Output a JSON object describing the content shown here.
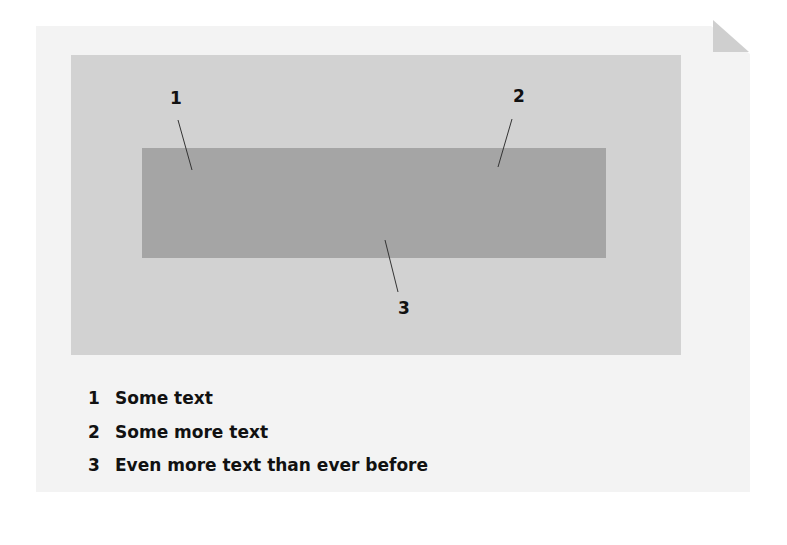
{
  "diagram": {
    "callouts": [
      {
        "id": "1",
        "label": "1"
      },
      {
        "id": "2",
        "label": "2"
      },
      {
        "id": "3",
        "label": "3"
      }
    ],
    "legend": [
      {
        "num": "1",
        "text": "Some text"
      },
      {
        "num": "2",
        "text": "Some more text"
      },
      {
        "num": "3",
        "text": "Even more text than ever before"
      }
    ],
    "colors": {
      "paper": "#f3f3f3",
      "panel": "#d2d2d2",
      "inner_rect": "#a5a5a5",
      "dogear": "#cfcfcf",
      "text": "#111111"
    }
  }
}
